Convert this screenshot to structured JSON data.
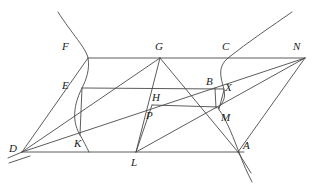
{
  "figure": {
    "type": "geometric-construction",
    "width": 314,
    "height": 184,
    "background_color": "#ffffff",
    "stroke_color": "#4a4a4a",
    "label_color": "#1a1a1a",
    "stroke_width": 0.9
  },
  "points": [
    {
      "id": "F",
      "label": "F",
      "x": 88,
      "y": 58,
      "label_x": 62,
      "label_y": 41
    },
    {
      "id": "G",
      "label": "G",
      "x": 160,
      "y": 58,
      "label_x": 155,
      "label_y": 41
    },
    {
      "id": "C",
      "label": "C",
      "x": 228,
      "y": 58,
      "label_x": 222,
      "label_y": 41
    },
    {
      "id": "N",
      "label": "N",
      "x": 305,
      "y": 58,
      "label_x": 293,
      "label_y": 41
    },
    {
      "id": "E",
      "label": "E",
      "x": 82,
      "y": 88,
      "label_x": 62,
      "label_y": 80
    },
    {
      "id": "B",
      "label": "B",
      "x": 215,
      "y": 88,
      "label_x": 206,
      "label_y": 80
    },
    {
      "id": "X",
      "label": "X",
      "x": 224,
      "y": 90,
      "label_x": 222,
      "label_y": 83
    },
    {
      "id": "H",
      "label": "H",
      "x": 157,
      "y": 88,
      "label_x": 152,
      "label_y": 96
    },
    {
      "id": "P",
      "label": "P",
      "x": 152,
      "y": 105,
      "label_x": 146,
      "label_y": 113
    },
    {
      "id": "M",
      "label": "M",
      "x": 218,
      "y": 108,
      "label_x": 221,
      "label_y": 118
    },
    {
      "id": "K",
      "label": "K",
      "x": 80,
      "y": 135,
      "label_x": 74,
      "label_y": 144
    },
    {
      "id": "D",
      "label": "D",
      "x": 22,
      "y": 152,
      "label_x": 9,
      "label_y": 146
    },
    {
      "id": "L",
      "label": "L",
      "x": 136,
      "y": 152,
      "label_x": 131,
      "label_y": 160
    },
    {
      "id": "A",
      "label": "A",
      "x": 238,
      "y": 152,
      "label_x": 243,
      "label_y": 143
    }
  ],
  "segments": [
    {
      "name": "top-line-F-N",
      "from": "F",
      "to": "N"
    },
    {
      "name": "chord-E-X",
      "from": "E",
      "to": "X"
    },
    {
      "name": "chord-H-M",
      "from": "H",
      "to": "M"
    },
    {
      "name": "base-line-D-A",
      "from": "D",
      "to": "A"
    },
    {
      "name": "side-D-F",
      "from": "D",
      "to": "F"
    },
    {
      "name": "side-A-N",
      "from": "A",
      "to": "N"
    },
    {
      "name": "diagonal-D-N",
      "from": "D",
      "to": "N"
    },
    {
      "name": "cevian-G-D",
      "from": "G",
      "to": "D"
    },
    {
      "name": "cevian-G-L",
      "from": "G",
      "to": "L"
    },
    {
      "name": "cevian-G-A",
      "from": "G",
      "to": "A"
    },
    {
      "name": "cevian-L-N",
      "from": "L",
      "to": "N"
    },
    {
      "name": "segment-E-K",
      "from": "E",
      "to": "K"
    },
    {
      "name": "segment-P-L",
      "from": "P",
      "to": "L"
    },
    {
      "name": "segment-B-M",
      "from": "B",
      "to": "M"
    },
    {
      "name": "segment-X-M",
      "from": "X",
      "to": "M"
    }
  ],
  "curves": [
    {
      "name": "left-hyperbola-branch",
      "description": "branch passing through F, E, K opening up-left",
      "path": "M 58 12 C 72 34, 86 48, 88 58 C 90 70, 86 80, 82 88 C 76 100, 70 118, 80 135 C 83 140, 86 146, 89 152"
    },
    {
      "name": "right-hyperbola-branch",
      "description": "branch passing through C, X, M, A opening up-right",
      "path": "M 292 12 C 272 26, 248 42, 228 58 C 216 68, 222 80, 224 90 C 226 99, 222 104, 218 108 C 228 122, 234 140, 239 152 C 243 164, 248 174, 252 182"
    }
  ],
  "extended_rays": [
    {
      "name": "ray-below-D-left",
      "from_x": 22,
      "from_y": 152,
      "to_x": 8,
      "to_y": 158
    },
    {
      "name": "ray-below-D-lower",
      "from_x": 26,
      "from_y": 155,
      "to_x": 9,
      "to_y": 162
    },
    {
      "name": "ray-below-A-right",
      "from_x": 238,
      "from_y": 152,
      "to_x": 250,
      "to_y": 172
    }
  ]
}
